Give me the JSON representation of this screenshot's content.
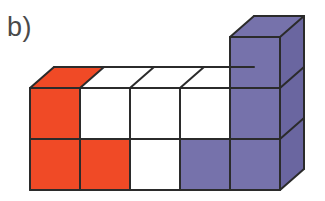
{
  "figure": {
    "label": "b)",
    "label_name": "figure-label-b",
    "kind": "cube-stack-diagram"
  },
  "palette": {
    "red_front": "#f04a26",
    "red_top": "#f04a26",
    "red_side": "#d23a18",
    "purple_front": "#7672ab",
    "purple_top": "#7672ab",
    "purple_side": "#6a66a0",
    "white_front": "#ffffff",
    "white_top": "#ffffff",
    "white_side": "#f4f4f4",
    "outline": "#2b2b2b",
    "background": "#ffffff",
    "label_color": "#4a4a4a"
  },
  "geometry": {
    "origin_x": 30,
    "origin_y": 190,
    "cell_w": 50,
    "cell_h": 51,
    "depth_dx": 24,
    "depth_dy": -21,
    "columns": 5,
    "rows": 2,
    "tall_column_index": 5,
    "tall_column_rows": 3,
    "stroke_width": 2.0
  },
  "cubes": {
    "note": "col = 1..5 left to right, row = 1 is bottom",
    "front_faces": [
      {
        "col": 1,
        "row": 1,
        "color": "red_front",
        "name": "cube-c1-r1"
      },
      {
        "col": 2,
        "row": 1,
        "color": "red_front",
        "name": "cube-c2-r1"
      },
      {
        "col": 3,
        "row": 1,
        "color": "white_front",
        "name": "cube-c3-r1"
      },
      {
        "col": 4,
        "row": 1,
        "color": "purple_front",
        "name": "cube-c4-r1"
      },
      {
        "col": 5,
        "row": 1,
        "color": "purple_front",
        "name": "cube-c5-r1"
      },
      {
        "col": 1,
        "row": 2,
        "color": "red_front",
        "name": "cube-c1-r2"
      },
      {
        "col": 2,
        "row": 2,
        "color": "white_front",
        "name": "cube-c2-r2"
      },
      {
        "col": 3,
        "row": 2,
        "color": "white_front",
        "name": "cube-c3-r2"
      },
      {
        "col": 4,
        "row": 2,
        "color": "white_front",
        "name": "cube-c4-r2"
      },
      {
        "col": 5,
        "row": 2,
        "color": "purple_front",
        "name": "cube-c5-r2"
      },
      {
        "col": 5,
        "row": 3,
        "color": "purple_front",
        "name": "cube-c5-r3"
      }
    ],
    "top_faces": [
      {
        "col": 1,
        "color": "red_top",
        "name": "cube-top-c1"
      },
      {
        "col": 2,
        "color": "white_top",
        "name": "cube-top-c2"
      },
      {
        "col": 3,
        "color": "white_top",
        "name": "cube-top-c3"
      },
      {
        "col": 4,
        "color": "white_top",
        "name": "cube-top-c4"
      },
      {
        "col": 5,
        "color": "purple_top",
        "name": "cube-top-c5"
      }
    ],
    "side_faces": [
      {
        "row": 1,
        "color": "purple_side",
        "name": "cube-side-r1"
      },
      {
        "row": 2,
        "color": "purple_side",
        "name": "cube-side-r2"
      },
      {
        "row": 3,
        "color": "purple_side",
        "name": "cube-side-r3"
      }
    ],
    "counts": {
      "red_visible": 3,
      "white_visible": 4,
      "purple_visible": 4,
      "total_visible_front": 11
    }
  }
}
